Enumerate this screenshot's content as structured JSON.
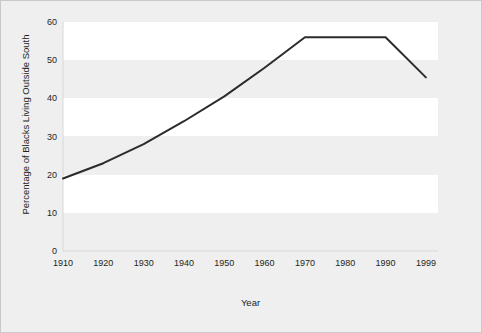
{
  "chart_data": {
    "type": "line",
    "title": "",
    "xlabel": "Year",
    "ylabel": "Percentage of Blacks Living Outside South",
    "x": [
      1910,
      1920,
      1930,
      1940,
      1950,
      1960,
      1970,
      1980,
      1990,
      1999
    ],
    "categories": [
      "1910",
      "1920",
      "1930",
      "1940",
      "1950",
      "1960",
      "1970",
      "1980",
      "1990",
      "1999"
    ],
    "values": [
      19,
      23,
      28,
      34,
      40.5,
      48,
      56,
      56,
      56,
      45.5
    ],
    "series": [
      {
        "name": "Percentage of Blacks Living Outside South",
        "values": [
          19,
          23,
          28,
          34,
          40.5,
          48,
          56,
          56,
          56,
          45.5
        ]
      }
    ],
    "xtick_labels": [
      "1910",
      "1920",
      "1930",
      "1940",
      "1950",
      "1960",
      "1970",
      "1980",
      "1990",
      "1999"
    ],
    "ytick_labels": [
      "0",
      "10",
      "20",
      "30",
      "40",
      "50",
      "60"
    ],
    "yticks": [
      0,
      10,
      20,
      30,
      40,
      50,
      60
    ],
    "ylim": [
      0,
      60
    ],
    "xlim": [
      1910,
      1999
    ],
    "grid": false,
    "legend": "none",
    "line_color": "#2b2b2b",
    "line_width": 2,
    "background_color": "#efefef",
    "band_color": "#ffffff",
    "border_color": "#c9c9c9",
    "text_color": "#231f20",
    "annotations": [],
    "banded_rows": [
      {
        "from": 10,
        "to": 20
      },
      {
        "from": 30,
        "to": 40
      },
      {
        "from": 50,
        "to": 60
      }
    ]
  }
}
